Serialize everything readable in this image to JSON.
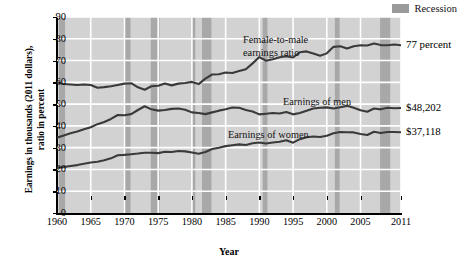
{
  "legend": {
    "swatch_name": "recession-swatch",
    "label": "Recession",
    "color": "#9a9a9a"
  },
  "axes": {
    "ylabel_line1": "Earnings in thousands (2011 dollars),",
    "ylabel_line2": "ratio in percent",
    "xlabel": "Year",
    "yticks": [
      0,
      10,
      20,
      30,
      40,
      50,
      60,
      70,
      80,
      90
    ],
    "xticks": [
      "1960",
      "1965",
      "1970",
      "1975",
      "1980",
      "1985",
      "1990",
      "1995",
      "2000",
      "2005",
      "2011"
    ]
  },
  "annotations": {
    "ratio_label_line1": "Female-to-male",
    "ratio_label_line2": "earnings ratio",
    "men_label": "Earnings of men",
    "women_label": "Earnings of women",
    "ratio_end": "77 percent",
    "men_end": "$48,202",
    "women_end": "$37,118"
  },
  "chart_data": {
    "type": "line",
    "title": "",
    "xlabel": "Year",
    "ylabel": "Earnings in thousands (2011 dollars), ratio in percent",
    "xlim": [
      1960,
      2011
    ],
    "ylim": [
      0,
      90
    ],
    "grid": true,
    "legend_position": "top-right",
    "line_color": "#3a3a3a",
    "plot_background": "#d2d2d2",
    "gridline_color": "#ffffff",
    "recession_band_color": "#a8a8a8",
    "x": [
      1960,
      1961,
      1962,
      1963,
      1964,
      1965,
      1966,
      1967,
      1968,
      1969,
      1970,
      1971,
      1972,
      1973,
      1974,
      1975,
      1976,
      1977,
      1978,
      1979,
      1980,
      1981,
      1982,
      1983,
      1984,
      1985,
      1986,
      1987,
      1988,
      1989,
      1990,
      1991,
      1992,
      1993,
      1994,
      1995,
      1996,
      1997,
      1998,
      1999,
      2000,
      2001,
      2002,
      2003,
      2004,
      2005,
      2006,
      2007,
      2008,
      2009,
      2010,
      2011
    ],
    "series": [
      {
        "name": "Female-to-male earnings ratio",
        "unit": "percent",
        "end_value": 77,
        "values": [
          60.0,
          59.2,
          59.0,
          58.8,
          59.0,
          58.8,
          57.5,
          57.8,
          58.2,
          58.8,
          59.4,
          59.6,
          57.7,
          56.6,
          58.2,
          58.4,
          59.5,
          58.6,
          59.4,
          59.7,
          60.2,
          59.2,
          61.7,
          63.6,
          63.7,
          64.5,
          64.3,
          65.2,
          66.0,
          68.7,
          71.6,
          69.9,
          70.6,
          71.5,
          72.0,
          71.4,
          73.8,
          74.2,
          73.2,
          72.2,
          73.3,
          76.3,
          76.6,
          75.5,
          76.6,
          77.0,
          76.9,
          77.8,
          77.1,
          77.0,
          77.4,
          77.0
        ]
      },
      {
        "name": "Earnings of men",
        "unit": "thousands of 2011 dollars",
        "end_value": 48.202,
        "values": [
          34.6,
          35.6,
          36.6,
          37.4,
          38.4,
          39.4,
          40.8,
          41.8,
          43.2,
          45.0,
          44.9,
          45.4,
          47.3,
          49.0,
          47.6,
          47.0,
          47.3,
          47.8,
          48.0,
          47.4,
          46.2,
          45.9,
          45.4,
          46.2,
          47.0,
          47.6,
          48.4,
          48.3,
          47.3,
          46.6,
          45.3,
          45.6,
          45.9,
          45.7,
          46.4,
          45.3,
          45.9,
          46.9,
          48.0,
          48.3,
          48.5,
          48.0,
          48.6,
          49.2,
          48.3,
          47.2,
          46.5,
          48.0,
          47.6,
          48.3,
          48.1,
          48.2
        ]
      },
      {
        "name": "Earnings of women",
        "unit": "thousands of 2011 dollars",
        "end_value": 37.118,
        "values": [
          20.8,
          21.1,
          21.6,
          22.0,
          22.6,
          23.2,
          23.5,
          24.2,
          25.1,
          26.5,
          26.7,
          27.0,
          27.3,
          27.7,
          27.7,
          27.5,
          28.1,
          28.0,
          28.5,
          28.3,
          27.8,
          27.2,
          28.0,
          29.4,
          30.0,
          30.7,
          31.1,
          31.5,
          31.2,
          32.0,
          32.4,
          31.9,
          32.4,
          32.7,
          33.4,
          32.3,
          33.9,
          34.8,
          35.1,
          34.9,
          35.5,
          36.6,
          37.2,
          37.1,
          37.0,
          36.3,
          35.8,
          37.3,
          36.7,
          37.2,
          37.2,
          37.1
        ]
      }
    ],
    "recessions": [
      {
        "start": 1960.3,
        "end": 1961.2
      },
      {
        "start": 1969.9,
        "end": 1970.9
      },
      {
        "start": 1973.9,
        "end": 1975.2
      },
      {
        "start": 1980.0,
        "end": 1980.5
      },
      {
        "start": 1981.5,
        "end": 1982.9
      },
      {
        "start": 1990.5,
        "end": 1991.2
      },
      {
        "start": 2001.2,
        "end": 2001.9
      },
      {
        "start": 2007.9,
        "end": 2009.4
      }
    ]
  }
}
